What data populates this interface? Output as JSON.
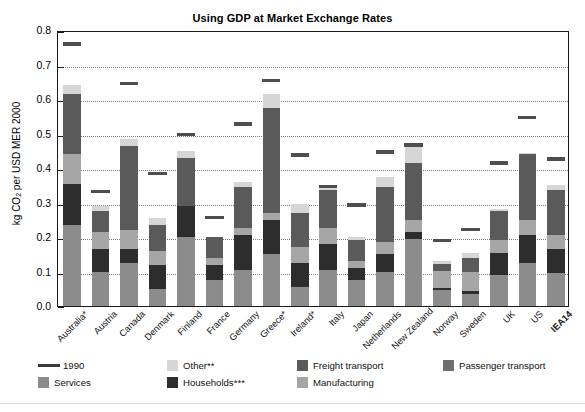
{
  "chart_data": {
    "type": "bar",
    "stacked": true,
    "title": "Using GDP at Market Exchange Rates",
    "xlabel": "",
    "ylabel": "kg CO2 per USD MER 2000",
    "ylim": [
      0.0,
      0.8
    ],
    "yticks": [
      "0.0",
      "0.1",
      "0.2",
      "0.3",
      "0.4",
      "0.5",
      "0.6",
      "0.7",
      "0.8"
    ],
    "grid": true,
    "legend_position": "bottom",
    "categories": [
      "Australia*",
      "Austria",
      "Canada",
      "Denmark",
      "Finland",
      "France",
      "Germany",
      "Greece*",
      "Ireland*",
      "Italy",
      "Japan",
      "Netherlands",
      "New Zealand",
      "Norway",
      "Sweden",
      "UK",
      "US",
      "IEA14"
    ],
    "series": [
      {
        "name": "Services",
        "color": "#8c8c8c",
        "values": [
          0.235,
          0.1,
          0.125,
          0.05,
          0.2,
          0.075,
          0.105,
          0.15,
          0.055,
          0.105,
          0.075,
          0.1,
          0.195,
          0.045,
          0.035,
          0.09,
          0.125,
          0.095
        ]
      },
      {
        "name": "Households***",
        "color": "#2d2d2d",
        "values": [
          0.12,
          0.065,
          0.04,
          0.07,
          0.09,
          0.045,
          0.1,
          0.1,
          0.07,
          0.075,
          0.035,
          0.05,
          0.02,
          0.008,
          0.01,
          0.065,
          0.08,
          0.07
        ]
      },
      {
        "name": "Manufacturing",
        "color": "#a6a6a6",
        "values": [
          0.085,
          0.05,
          0.055,
          0.04,
          0.0,
          0.02,
          0.02,
          0.02,
          0.045,
          0.045,
          0.02,
          0.035,
          0.035,
          0.048,
          0.055,
          0.035,
          0.045,
          0.04
        ]
      },
      {
        "name": "Freight transport",
        "color": "#5a5a5a",
        "values": [
          0.175,
          0.06,
          0.245,
          0.075,
          0.14,
          0.06,
          0.12,
          0.305,
          0.1,
          0.11,
          0.06,
          0.16,
          0.165,
          0.02,
          0.04,
          0.085,
          0.19,
          0.13
        ]
      },
      {
        "name": "Other**",
        "color": "#d6d6d6",
        "values": [
          0.025,
          0.015,
          0.02,
          0.02,
          0.02,
          0.0,
          0.015,
          0.04,
          0.025,
          0.01,
          0.01,
          0.03,
          0.055,
          0.01,
          0.015,
          0.005,
          0.005,
          0.015
        ]
      }
    ],
    "marker_series": {
      "name": "1990",
      "color": "#4e4e4e",
      "values": [
        0.765,
        0.337,
        0.65,
        0.39,
        0.503,
        0.263,
        0.533,
        0.66,
        0.443,
        0.352,
        0.298,
        0.452,
        0.472,
        0.195,
        0.228,
        0.42,
        0.553,
        0.432
      ]
    }
  },
  "legend": {
    "entries": [
      {
        "label": "1990",
        "kind": "line",
        "color": "#3a3a3a"
      },
      {
        "label": "Other**",
        "kind": "swatch",
        "color": "#d6d6d6"
      },
      {
        "label": "Freight transport",
        "kind": "swatch",
        "color": "#5a5a5a"
      },
      {
        "label": "Passenger transport",
        "kind": "swatch",
        "color": "#6f6f6f"
      },
      {
        "label": "Services",
        "kind": "swatch",
        "color": "#8c8c8c"
      },
      {
        "label": "Households***",
        "kind": "swatch",
        "color": "#2d2d2d"
      },
      {
        "label": "Manufacturing",
        "kind": "swatch",
        "color": "#a6a6a6"
      }
    ]
  }
}
